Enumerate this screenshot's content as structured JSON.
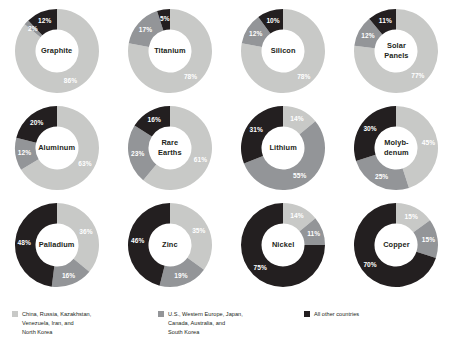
{
  "chart_data": {
    "type": "pie",
    "title": "",
    "subtitle": "",
    "variant": "donut",
    "legend_position": "bottom",
    "series_names": [
      "China, Russia, Kazakhstan, Venezuela, Iran, and North Korea",
      "U.S., Western Europe, Japan, Canada, Australia, and South Korea",
      "All other countries"
    ],
    "series_colors": [
      "#c8c9c7",
      "#939598",
      "#231f20"
    ],
    "unit": "%",
    "charts": [
      {
        "label": "Graphite",
        "slices": [
          {
            "group": "china-bloc",
            "value": 86,
            "display": "86%"
          },
          {
            "group": "western-bloc",
            "value": 2,
            "display": "2%"
          },
          {
            "group": "other",
            "value": 12,
            "display": "12%"
          }
        ]
      },
      {
        "label": "Titanium",
        "slices": [
          {
            "group": "china-bloc",
            "value": 78,
            "display": "78%"
          },
          {
            "group": "western-bloc",
            "value": 17,
            "display": "17%"
          },
          {
            "group": "other",
            "value": 5,
            "display": "5%"
          }
        ]
      },
      {
        "label": "Silicon",
        "slices": [
          {
            "group": "china-bloc",
            "value": 78,
            "display": "78%"
          },
          {
            "group": "western-bloc",
            "value": 12,
            "display": "12%"
          },
          {
            "group": "other",
            "value": 10,
            "display": "10%"
          }
        ]
      },
      {
        "label": "Solar\nPanels",
        "slices": [
          {
            "group": "china-bloc",
            "value": 77,
            "display": "77%"
          },
          {
            "group": "western-bloc",
            "value": 12,
            "display": "12%"
          },
          {
            "group": "other",
            "value": 11,
            "display": "11%"
          }
        ]
      },
      {
        "label": "Aluminum",
        "slices": [
          {
            "group": "china-bloc",
            "value": 63,
            "display": "63%"
          },
          {
            "group": "western-bloc",
            "value": 12,
            "display": "12%"
          },
          {
            "group": "other",
            "value": 20,
            "display": "20%"
          }
        ]
      },
      {
        "label": "Rare\nEarths",
        "slices": [
          {
            "group": "china-bloc",
            "value": 61,
            "display": "61%"
          },
          {
            "group": "western-bloc",
            "value": 23,
            "display": "23%"
          },
          {
            "group": "other",
            "value": 16,
            "display": "16%"
          }
        ]
      },
      {
        "label": "Lithium",
        "slices": [
          {
            "group": "china-bloc",
            "value": 14,
            "display": "14%"
          },
          {
            "group": "western-bloc",
            "value": 55,
            "display": "55%"
          },
          {
            "group": "other",
            "value": 31,
            "display": "31%"
          }
        ]
      },
      {
        "label": "Molyb-\ndenum",
        "slices": [
          {
            "group": "china-bloc",
            "value": 45,
            "display": "45%"
          },
          {
            "group": "western-bloc",
            "value": 25,
            "display": "25%"
          },
          {
            "group": "other",
            "value": 30,
            "display": "30%"
          }
        ]
      },
      {
        "label": "Palladium",
        "slices": [
          {
            "group": "china-bloc",
            "value": 36,
            "display": "36%"
          },
          {
            "group": "western-bloc",
            "value": 16,
            "display": "16%"
          },
          {
            "group": "other",
            "value": 48,
            "display": "48%"
          }
        ]
      },
      {
        "label": "Zinc",
        "slices": [
          {
            "group": "china-bloc",
            "value": 35,
            "display": "35%"
          },
          {
            "group": "western-bloc",
            "value": 19,
            "display": "19%"
          },
          {
            "group": "other",
            "value": 46,
            "display": "46%"
          }
        ]
      },
      {
        "label": "Nickel",
        "slices": [
          {
            "group": "china-bloc",
            "value": 14,
            "display": "14%"
          },
          {
            "group": "western-bloc",
            "value": 11,
            "display": "11%"
          },
          {
            "group": "other",
            "value": 75,
            "display": "75%"
          }
        ]
      },
      {
        "label": "Copper",
        "slices": [
          {
            "group": "china-bloc",
            "value": 15,
            "display": "15%"
          },
          {
            "group": "western-bloc",
            "value": 15,
            "display": "15%"
          },
          {
            "group": "other",
            "value": 70,
            "display": "70%"
          }
        ]
      }
    ]
  },
  "legend": {
    "items": [
      {
        "color": "#c8c9c7",
        "label": "China, Russia, Kazakhstan,\nVenezuela, Iran, and\nNorth Korea"
      },
      {
        "color": "#939598",
        "label": "U.S., Western Europe, Japan,\nCanada, Australia, and\nSouth Korea"
      },
      {
        "color": "#231f20",
        "label": "All other countries"
      }
    ]
  }
}
